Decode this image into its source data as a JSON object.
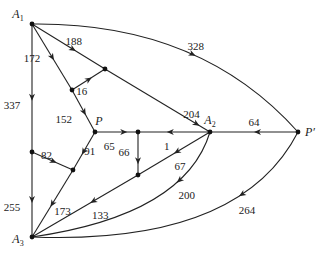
{
  "nodes": [
    {
      "id": "A1",
      "label": "A",
      "sub": "1"
    },
    {
      "id": "A2",
      "label": "A",
      "sub": "2"
    },
    {
      "id": "A3",
      "label": "A",
      "sub": "3"
    },
    {
      "id": "P",
      "label": "P",
      "sub": ""
    },
    {
      "id": "Pp",
      "label": "P′",
      "sub": ""
    },
    {
      "id": "n1",
      "label": "",
      "sub": ""
    },
    {
      "id": "n2",
      "label": "",
      "sub": ""
    },
    {
      "id": "n3",
      "label": "",
      "sub": ""
    },
    {
      "id": "n4",
      "label": "",
      "sub": ""
    },
    {
      "id": "n5",
      "label": "",
      "sub": ""
    },
    {
      "id": "n6",
      "label": "",
      "sub": ""
    }
  ],
  "edges": [
    {
      "from": "A1",
      "to": "Pp",
      "weight": "328"
    },
    {
      "from": "A1",
      "to": "n2",
      "weight": "188"
    },
    {
      "from": "n2",
      "to": "A2",
      "weight": "204"
    },
    {
      "from": "A1",
      "to": "n1",
      "weight": "172"
    },
    {
      "from": "n1",
      "to": "n2",
      "weight": "16"
    },
    {
      "from": "n1",
      "to": "P",
      "weight": "152"
    },
    {
      "from": "A1",
      "to": "n5",
      "weight": "337"
    },
    {
      "from": "n5",
      "to": "A3",
      "weight": "255"
    },
    {
      "from": "n5",
      "to": "n6",
      "weight": "82"
    },
    {
      "from": "P",
      "to": "n6",
      "weight": "91"
    },
    {
      "from": "n6",
      "to": "A3",
      "weight": "173"
    },
    {
      "from": "P",
      "to": "n3",
      "weight": "65"
    },
    {
      "from": "A2",
      "to": "n3",
      "weight": "1"
    },
    {
      "from": "n3",
      "to": "n4",
      "weight": "66"
    },
    {
      "from": "A2",
      "to": "n4",
      "weight": "67"
    },
    {
      "from": "n4",
      "to": "A3",
      "weight": "133"
    },
    {
      "from": "A2",
      "to": "A3",
      "weight": "200"
    },
    {
      "from": "Pp",
      "to": "A2",
      "weight": "64"
    },
    {
      "from": "Pp",
      "to": "A3",
      "weight": "264"
    }
  ]
}
